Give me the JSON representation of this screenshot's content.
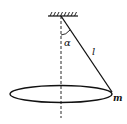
{
  "diagram": {
    "labels": {
      "angle": "α",
      "length": "l",
      "mass": "m"
    },
    "colors": {
      "stroke": "#111111",
      "background": "#ffffff"
    }
  }
}
